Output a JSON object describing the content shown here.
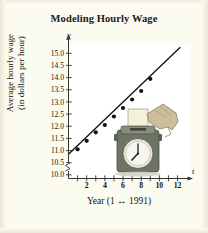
{
  "figure": {
    "title": "Modeling Hourly Wage",
    "background_color": "#fcfbf0",
    "plot_background_color": "#ffffff"
  },
  "axes": {
    "y_axis_letter": "y",
    "x_axis_letter": "t",
    "y_label_line1": "Average hourly wage",
    "y_label_line2": "(in dollars per hour)",
    "x_label": "Year (1 ↔ 1991)",
    "y_ticks": [
      "15.0",
      "14.5",
      "14.0",
      "13.5",
      "13.0",
      "12.5",
      "12.0",
      "11.5",
      "11.0",
      "10.5",
      "10.0"
    ],
    "x_ticks_labeled": [
      "2",
      "4",
      "6",
      "8",
      "10",
      "12"
    ],
    "axis_break": true
  },
  "illustration": {
    "name": "time-clock-with-hand-inserting-timecard",
    "clock_time": "8:00",
    "card_color": "#f3efd8",
    "clock_body_color": "#6d7464",
    "hand_color": "#cdbe9a"
  },
  "chart_data": {
    "type": "scatter",
    "title": "Modeling Hourly Wage",
    "xlabel": "Year (1 ↔ 1991)",
    "ylabel": "Average hourly wage (in dollars per hour)",
    "xlim": [
      0,
      12.6
    ],
    "ylim": [
      9.85,
      15.3
    ],
    "grid": false,
    "legend": "none",
    "x": [
      1,
      2,
      3,
      4,
      5,
      6,
      7,
      8,
      9
    ],
    "y": [
      11.05,
      11.4,
      11.75,
      12.05,
      12.4,
      12.75,
      13.1,
      13.45,
      13.95
    ],
    "series": [
      {
        "name": "Average hourly wage",
        "type": "scatter",
        "x": [
          1,
          2,
          3,
          4,
          5,
          6,
          7,
          8,
          9
        ],
        "values": [
          11.05,
          11.4,
          11.75,
          12.05,
          12.4,
          12.75,
          13.1,
          13.45,
          13.95
        ]
      },
      {
        "name": "Least squares regression line",
        "type": "line",
        "x": [
          0,
          12.3
        ],
        "values": [
          10.85,
          15.25
        ]
      }
    ],
    "annotations": [
      "axis break on y-axis below 10.0"
    ]
  }
}
